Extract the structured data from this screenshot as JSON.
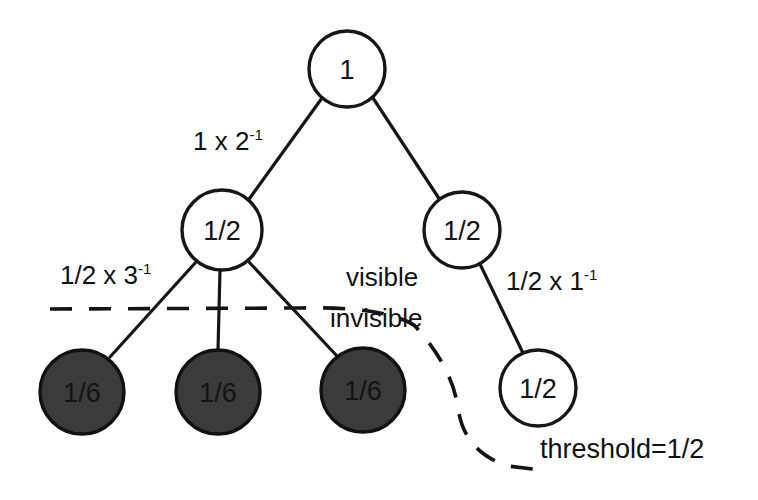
{
  "diagram": {
    "nodes": [
      {
        "id": "root",
        "label": "1",
        "x": 347,
        "y": 69,
        "r": 38,
        "style": "open"
      },
      {
        "id": "l1",
        "label": "1/2",
        "x": 222,
        "y": 230,
        "r": 40,
        "style": "open"
      },
      {
        "id": "r1",
        "label": "1/2",
        "x": 462,
        "y": 230,
        "r": 38,
        "style": "open"
      },
      {
        "id": "leaf1",
        "label": "1/6",
        "x": 82,
        "y": 392,
        "r": 42,
        "style": "filled"
      },
      {
        "id": "leaf2",
        "label": "1/6",
        "x": 218,
        "y": 392,
        "r": 42,
        "style": "filled"
      },
      {
        "id": "leaf3",
        "label": "1/6",
        "x": 363,
        "y": 390,
        "r": 42,
        "style": "filled"
      },
      {
        "id": "r2",
        "label": "1/2",
        "x": 538,
        "y": 388,
        "r": 38,
        "style": "open"
      }
    ],
    "edges": [
      {
        "id": "root-l1",
        "from": "root",
        "to": "l1"
      },
      {
        "id": "root-r1",
        "from": "root",
        "to": "r1"
      },
      {
        "id": "l1-leaf1",
        "from": "l1",
        "to": "leaf1"
      },
      {
        "id": "l1-leaf2",
        "from": "l1",
        "to": "leaf2"
      },
      {
        "id": "l1-leaf3",
        "from": "l1",
        "to": "leaf3"
      },
      {
        "id": "r1-r2",
        "from": "r1",
        "to": "r2"
      }
    ],
    "edge_labels": {
      "root_to_left": {
        "base": "1 x 2",
        "exponent": "-1"
      },
      "left_to_leaf1": {
        "base": "1/2 x 3",
        "exponent": "-1"
      },
      "right_to_down": {
        "base": "1/2 x 1",
        "exponent": "-1"
      }
    },
    "region_labels": {
      "visible": "visible",
      "invisible": "invisible"
    },
    "threshold_label": "threshold=1/2",
    "colors": {
      "stroke": "#161616",
      "node_fill_open": "#ffffff",
      "node_fill_filled": "#3b3b3b",
      "background": "#ffffff"
    },
    "threshold_curve": "dashed boundary separating visible nodes above from invisible nodes below"
  }
}
